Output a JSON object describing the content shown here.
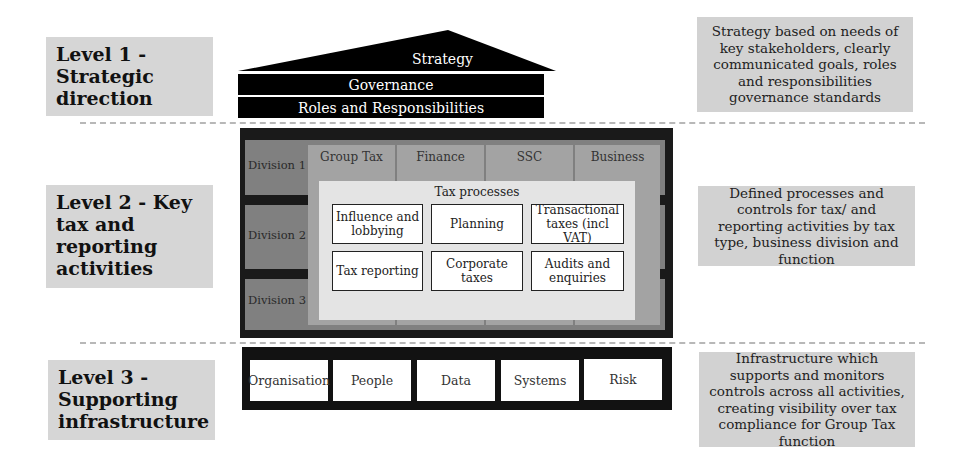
{
  "levels": [
    {
      "label": "Level 1 - Strategic direction",
      "lines": [
        "Level 1 -",
        "Strategic",
        "direction"
      ],
      "description": "Strategy based on needs of key stakeholders, clearly communicated goals, roles and responsibilities governance standards"
    },
    {
      "label": "Level 2 - Key tax and reporting activities",
      "lines": [
        "Level 2 - Key",
        "tax and",
        "reporting",
        "activities"
      ],
      "description": "Defined processes and controls for tax/ and reporting activities by tax type, business division and function"
    },
    {
      "label": "Level 3 - Supporting infrastructure",
      "lines": [
        "Level 3 -",
        "Supporting",
        "infrastructure"
      ],
      "description": "Infrastructure which supports and monitors controls across all activities, creating visibility over tax compliance for Group Tax function"
    }
  ],
  "roof": {
    "strategy": "Strategy",
    "governance": "Governance",
    "roles": "Roles and Responsibilities"
  },
  "level2": {
    "divisions": [
      "Division 1",
      "Division 2",
      "Division 3"
    ],
    "functions": [
      "Group Tax",
      "Finance",
      "SSC",
      "Business"
    ],
    "tax_processes": {
      "title": "Tax processes",
      "items": [
        "Influence and lobbying",
        "Planning",
        "Transactional taxes (incl VAT)",
        "Tax reporting",
        "Corporate taxes",
        "Audits and enquiries"
      ]
    }
  },
  "level3": {
    "items": [
      "Organisation",
      "People",
      "Data",
      "Systems",
      "Risk"
    ]
  },
  "colors": {
    "label_bg": "#d6d6d6",
    "frame": "#1a1a1a",
    "division": "#808080",
    "function_col": "#a3a3a3",
    "tax_panel": "#e4e4e4"
  }
}
